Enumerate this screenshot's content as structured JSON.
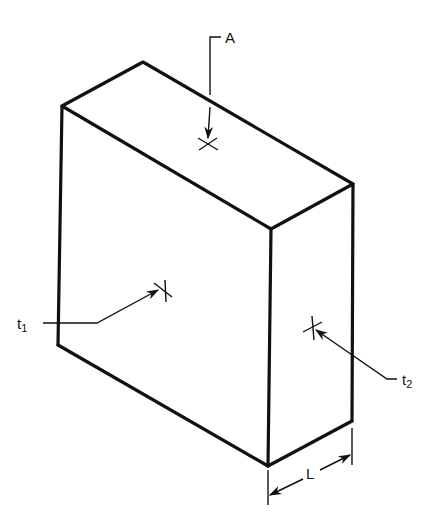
{
  "diagram": {
    "title": "",
    "type": "isometric slab with thickness, area and temperature labels",
    "labels": {
      "area": "A",
      "t1_base": "t",
      "t1_sub": "1",
      "t2_base": "t",
      "t2_sub": "2",
      "length": "L"
    },
    "colors": {
      "line": "#111111",
      "background": "#ffffff"
    }
  }
}
